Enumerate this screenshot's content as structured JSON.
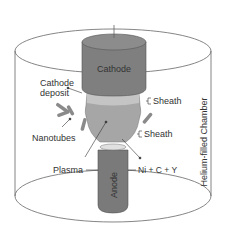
{
  "diagram": {
    "labels": {
      "cathode": "Cathode",
      "cathode_deposit_line1": "Cathode",
      "cathode_deposit_line2": "deposit",
      "sheath_top": "Sheath",
      "sheath_bottom": "Sheath",
      "nanotubes": "Nanotubes",
      "plasma": "Plasma",
      "anode": "Anode",
      "anode_composition": "Ni + C + Y",
      "chamber": "Helium-filled Chamber"
    },
    "colors": {
      "cathode": "#7f7f7f",
      "cathode_top": "#8c8c8c",
      "anode": "#7a7a7a",
      "plasma": "#a6a6a6",
      "deposit": "#c4c4c4",
      "outline": "#555555",
      "text": "#333333"
    }
  }
}
